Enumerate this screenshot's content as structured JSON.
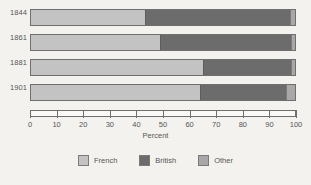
{
  "chart_data": {
    "type": "bar",
    "orientation": "horizontal",
    "stacked": true,
    "stacked_mode": "percent",
    "title": "",
    "xlabel": "Percent",
    "ylabel": "",
    "xlim": [
      0,
      100
    ],
    "grid": false,
    "legend_position": "bottom",
    "categories": [
      "1844",
      "1861",
      "1881",
      "1901"
    ],
    "xticks": [
      0,
      10,
      20,
      30,
      40,
      50,
      60,
      70,
      80,
      90,
      100
    ],
    "xtick_labels": [
      "0",
      "10",
      "20",
      "30",
      "40",
      "50",
      "60",
      "70",
      "80",
      "90",
      "100"
    ],
    "series": [
      {
        "name": "French",
        "color": "#c3c3c3",
        "values": [
          43,
          49,
          65,
          64
        ]
      },
      {
        "name": "British",
        "color": "#6c6c6c",
        "values": [
          55,
          49.5,
          33.5,
          32.5
        ]
      },
      {
        "name": "Other",
        "color": "#a8a8a8",
        "values": [
          2,
          1.5,
          1.5,
          3.5
        ]
      }
    ]
  },
  "axis": {
    "x_title": "Percent"
  },
  "legend": {
    "items": [
      {
        "label": "French",
        "color": "#c3c3c3"
      },
      {
        "label": "British",
        "color": "#6c6c6c"
      },
      {
        "label": "Other",
        "color": "#a8a8a8"
      }
    ]
  },
  "caption": {
    "text": ""
  }
}
